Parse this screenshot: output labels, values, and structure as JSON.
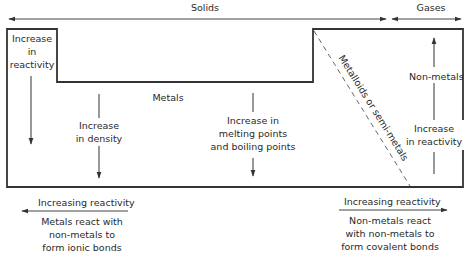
{
  "header": {
    "solids_label": "Solids",
    "gases_label": "Gases"
  },
  "regions": {
    "left_column": {
      "line1": "Increase",
      "line2": "in",
      "line3": "reactivity"
    },
    "metals_label": "Metals",
    "density": {
      "line1": "Increase",
      "line2": "in density"
    },
    "melting": {
      "line1": "Increase in",
      "line2": "melting points",
      "line3": "and boiling points"
    },
    "metalloids_label": "Metalloids or semi-metals",
    "nonmetals": {
      "label": "Non-metals",
      "line1": "Increase",
      "line2": "in reactivity"
    }
  },
  "footer": {
    "left": {
      "arrow_label": "Increasing reactivity",
      "line1": "Metals react with",
      "line2": "non-metals to",
      "line3": "form ionic bonds"
    },
    "right": {
      "arrow_label": "Increasing reactivity",
      "line1": "Non-metals react",
      "line2": "with non-metals to",
      "line3": "form covalent bonds"
    }
  },
  "colors": {
    "line": "#333333",
    "background": "#ffffff"
  }
}
